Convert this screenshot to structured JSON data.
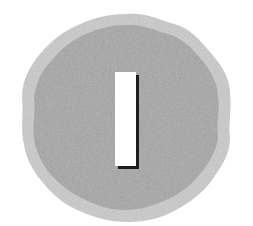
{
  "badge": {
    "glyph": "I",
    "description": "Wavy-edged gray seal badge with a white vertical bar (letter I)",
    "colors": {
      "background": "#ffffff",
      "outer_ring": "#c9c9c9",
      "inner_fill": "#a6a6a6",
      "bar_fill": "#ffffff",
      "bar_shadow": "#1e1e1e"
    }
  }
}
